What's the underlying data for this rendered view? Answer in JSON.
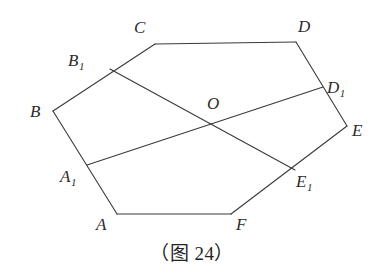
{
  "figure": {
    "caption": "（图 24）",
    "caption_position": {
      "x": 0,
      "y": 238
    },
    "canvas": {
      "width": 384,
      "height": 276
    },
    "stroke_color": "#3a3a3a",
    "stroke_width": 1.1,
    "background_color": "#ffffff",
    "label_color": "#2b2b2b"
  },
  "chart_data": {
    "type": "diagram",
    "title": "（图 24）",
    "points": [
      {
        "id": "A",
        "label": "A",
        "sub": "",
        "x": 117,
        "y": 214,
        "label_x": 96,
        "label_y": 216
      },
      {
        "id": "B",
        "label": "B",
        "sub": "",
        "x": 53,
        "y": 111,
        "label_x": 30,
        "label_y": 103
      },
      {
        "id": "C",
        "label": "C",
        "sub": "",
        "x": 155,
        "y": 44,
        "label_x": 134,
        "label_y": 19
      },
      {
        "id": "D",
        "label": "D",
        "sub": "",
        "x": 296,
        "y": 42,
        "label_x": 298,
        "label_y": 18
      },
      {
        "id": "E",
        "label": "E",
        "sub": "",
        "x": 347,
        "y": 126,
        "label_x": 352,
        "label_y": 122
      },
      {
        "id": "F",
        "label": "F",
        "sub": "",
        "x": 231,
        "y": 214,
        "label_x": 236,
        "label_y": 216
      },
      {
        "id": "A1",
        "label": "A",
        "sub": "1",
        "x": 87,
        "y": 165,
        "label_x": 60,
        "label_y": 168
      },
      {
        "id": "B1",
        "label": "B",
        "sub": "1",
        "x": 110,
        "y": 69,
        "label_x": 68,
        "label_y": 52
      },
      {
        "id": "D1",
        "label": "D",
        "sub": "1",
        "x": 323,
        "y": 87,
        "label_x": 327,
        "label_y": 79
      },
      {
        "id": "E1",
        "label": "E",
        "sub": "1",
        "x": 295,
        "y": 170,
        "label_x": 296,
        "label_y": 173
      },
      {
        "id": "O",
        "label": "O",
        "sub": "",
        "x": 213,
        "y": 122,
        "label_x": 207,
        "label_y": 95
      }
    ],
    "edges": [
      {
        "name": "side-AB",
        "from": "A",
        "to": "B"
      },
      {
        "name": "side-BC",
        "from": "B",
        "to": "C"
      },
      {
        "name": "side-CD",
        "from": "C",
        "to": "D"
      },
      {
        "name": "side-DE",
        "from": "D",
        "to": "E"
      },
      {
        "name": "side-EF",
        "from": "E",
        "to": "F"
      },
      {
        "name": "side-FA",
        "from": "F",
        "to": "A"
      },
      {
        "name": "chord-B1E1",
        "from": "B1",
        "to": "E1"
      },
      {
        "name": "chord-A1D1",
        "from": "A1",
        "to": "D1"
      }
    ]
  }
}
